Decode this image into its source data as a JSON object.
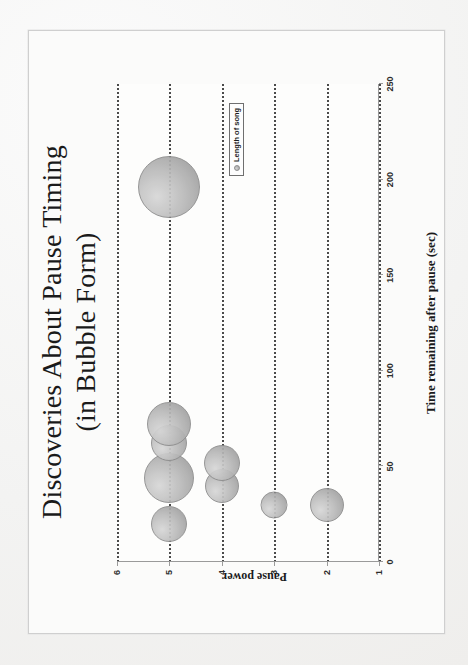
{
  "page": {
    "background_color": "#f2f2f2",
    "paper_color": "#fbfbfa",
    "frame_color": "#cfcfcf",
    "rotation_note": "slide rotated 90 degrees counter-clockwise"
  },
  "slide": {
    "title_line1": "Discoveries About Pause Timing",
    "title_line2": "(in Bubble Form)"
  },
  "legend": {
    "marker": "bubble-marker",
    "label": "Length of song",
    "position": "inside-plot-upper-right"
  },
  "chart_data": {
    "type": "scatter",
    "title": "Discoveries About Pause Timing (in Bubble Form)",
    "subtitle": "(in Bubble Form)",
    "xlabel": "Time remaining after pause (sec)",
    "ylabel": "Pause power",
    "xlim": [
      0,
      250
    ],
    "ylim": [
      1,
      6
    ],
    "xticks": [
      0,
      50,
      100,
      150,
      200,
      250
    ],
    "yticks": [
      1,
      2,
      3,
      4,
      5,
      6
    ],
    "xtick_labels": [
      "0",
      "50",
      "100",
      "150",
      "200",
      "250"
    ],
    "ytick_labels": [
      "1",
      "2",
      "3",
      "4",
      "5",
      "6"
    ],
    "grid": "horizontal-dotted-per-y-category",
    "legend_entries": [
      "Length of song"
    ],
    "size_encoding": "bubble area = length of song",
    "series": [
      {
        "name": "Length of song",
        "points": [
          {
            "x": 196,
            "y": 5,
            "size": 62,
            "label": ""
          },
          {
            "x": 72,
            "y": 5,
            "size": 44,
            "label": ""
          },
          {
            "x": 62,
            "y": 5,
            "size": 36,
            "label": ""
          },
          {
            "x": 44,
            "y": 5,
            "size": 50,
            "label": ""
          },
          {
            "x": 20,
            "y": 5,
            "size": 36,
            "label": ""
          },
          {
            "x": 52,
            "y": 4,
            "size": 36,
            "label": ""
          },
          {
            "x": 40,
            "y": 4,
            "size": 34,
            "label": ""
          },
          {
            "x": 30,
            "y": 3,
            "size": 27,
            "label": ""
          },
          {
            "x": 30,
            "y": 2,
            "size": 34,
            "label": ""
          }
        ]
      }
    ]
  }
}
